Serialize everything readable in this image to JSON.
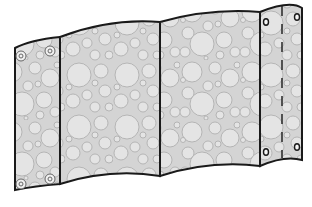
{
  "illustration": {
    "subject": "folding wavy panel screen with bubble texture",
    "panels": [
      {
        "id": "panel-1",
        "grommets": 4
      },
      {
        "id": "panel-2",
        "grommets": 0
      },
      {
        "id": "panel-3",
        "grommets": 0
      },
      {
        "id": "panel-4",
        "grommets": 4,
        "has_dashed_seam": true
      }
    ],
    "colors": {
      "outline": "#1a1a1a",
      "fill": "#d9d9d9",
      "bubble_edge": "#a8a8a8",
      "bubble_fill": "#e2e2e2",
      "background": "#ffffff"
    }
  }
}
